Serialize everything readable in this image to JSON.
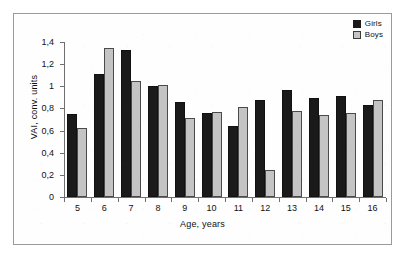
{
  "chart_data": {
    "type": "bar",
    "title": "",
    "xlabel": "Age, years",
    "ylabel": "VAI, conv. units",
    "categories": [
      "5",
      "6",
      "7",
      "8",
      "9",
      "10",
      "11",
      "12",
      "13",
      "14",
      "15",
      "16"
    ],
    "series": [
      {
        "name": "Girls",
        "color": "#1a1a1a",
        "values": [
          0.75,
          1.11,
          1.33,
          1.0,
          0.86,
          0.76,
          0.64,
          0.88,
          0.97,
          0.89,
          0.91,
          0.83
        ]
      },
      {
        "name": "Boys",
        "color": "#c4c4c4",
        "values": [
          0.62,
          1.35,
          1.05,
          1.01,
          0.71,
          0.77,
          0.81,
          0.24,
          0.78,
          0.74,
          0.76,
          0.88
        ]
      }
    ],
    "ylim": [
      0,
      1.4
    ],
    "ytick_values": [
      0,
      0.2,
      0.4,
      0.6,
      0.8,
      1.0,
      1.2,
      1.4
    ],
    "ytick_labels": [
      "0",
      "0,2",
      "0,4",
      "0,6",
      "0,8",
      "1",
      "1,2",
      "1,4"
    ],
    "grid": false,
    "legend_position": "top-right",
    "decimal_separator": ","
  },
  "legend": {
    "entries": [
      {
        "label": "Girls",
        "swatch": "filled-black-square-icon"
      },
      {
        "label": "Boys",
        "swatch": "light-gray-square-icon"
      }
    ]
  }
}
